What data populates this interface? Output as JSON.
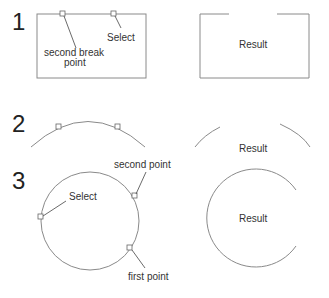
{
  "steps": [
    {
      "number": "1",
      "shape": "rectangle",
      "labels": {
        "select": "Select",
        "second_break_line1": "second break",
        "second_break_line2": "point"
      },
      "result_label": "Result"
    },
    {
      "number": "2",
      "shape": "arc",
      "result_label": "Result"
    },
    {
      "number": "3",
      "shape": "circle",
      "labels": {
        "select": "Select",
        "second_point": "second point",
        "first_point": "first point"
      },
      "result_label": "Result"
    }
  ],
  "colors": {
    "line": "#8a8a8a",
    "text": "#333333",
    "background": "#ffffff"
  }
}
